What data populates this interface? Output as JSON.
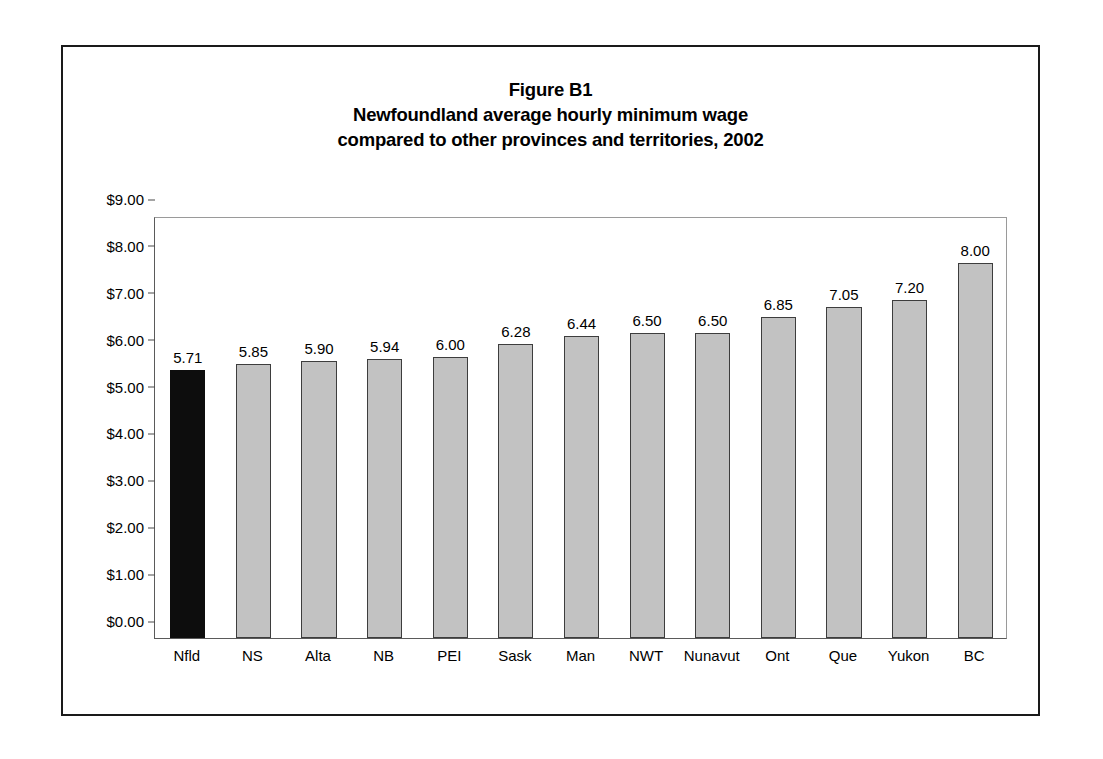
{
  "figure": {
    "title_lines": [
      "Figure B1",
      "Newfoundland average hourly minimum wage",
      "compared to other provinces and territories, 2002"
    ]
  },
  "chart_data": {
    "type": "bar",
    "title": "Figure B1 Newfoundland average hourly minimum wage compared to other provinces and territories, 2002",
    "xlabel": "",
    "ylabel": "",
    "ylim": [
      0,
      9
    ],
    "ytick_step": 1,
    "grid": false,
    "legend": null,
    "value_label_format": "2 decimals, no currency symbol",
    "ytick_label_format": "currency, 2 decimals",
    "categories": [
      "Nfld",
      "NS",
      "Alta",
      "NB",
      "PEI",
      "Sask",
      "Man",
      "NWT",
      "Nunavut",
      "Ont",
      "Que",
      "Yukon",
      "BC"
    ],
    "values": [
      5.71,
      5.85,
      5.9,
      5.94,
      6.0,
      6.28,
      6.44,
      6.5,
      6.5,
      6.85,
      7.05,
      7.2,
      8.0
    ],
    "value_labels": [
      "5.71",
      "5.85",
      "5.90",
      "5.94",
      "6.00",
      "6.28",
      "6.44",
      "6.50",
      "6.50",
      "6.85",
      "7.05",
      "7.20",
      "8.00"
    ],
    "ytick_labels": [
      "$0.00",
      "$1.00",
      "$2.00",
      "$3.00",
      "$4.00",
      "$5.00",
      "$6.00",
      "$7.00",
      "$8.00",
      "$9.00"
    ],
    "ytick_values": [
      0,
      1,
      2,
      3,
      4,
      5,
      6,
      7,
      8,
      9
    ],
    "highlight_index": 0,
    "colors": {
      "bar_fill": "#c2c2c2",
      "bar_border": "#3d3d3d",
      "highlight_fill": "#0d0d0d",
      "axis": "#5a5a5a",
      "frame": "#1a1a1a",
      "text": "#000000",
      "background": "#ffffff"
    }
  }
}
